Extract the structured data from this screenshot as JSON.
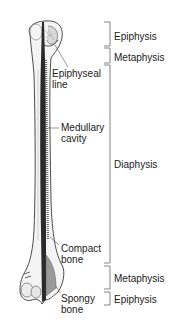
{
  "figure": {
    "structure_labels": [
      {
        "id": "epiphyseal-line",
        "lines": [
          "Epiphyseal",
          "line"
        ]
      },
      {
        "id": "medullary-cavity",
        "lines": [
          "Medullary",
          "cavity"
        ]
      },
      {
        "id": "compact-bone",
        "lines": [
          "Compact",
          "bone"
        ]
      },
      {
        "id": "spongy-bone",
        "lines": [
          "Spongy",
          "bone"
        ]
      }
    ],
    "region_labels": [
      {
        "id": "proximal-epiphysis",
        "label": "Epiphysis"
      },
      {
        "id": "proximal-metaphysis",
        "label": "Metaphysis"
      },
      {
        "id": "diaphysis",
        "label": "Diaphysis"
      },
      {
        "id": "distal-metaphysis",
        "label": "Metaphysis"
      },
      {
        "id": "distal-epiphysis",
        "label": "Epiphysis"
      }
    ]
  }
}
